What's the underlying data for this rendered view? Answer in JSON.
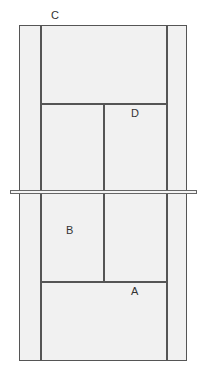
{
  "diagram": {
    "type": "tennis-court",
    "labels": {
      "c": "C",
      "d": "D",
      "b": "B",
      "a": "A"
    },
    "colors": {
      "court_fill": "#f1f1f1",
      "line": "#555555",
      "background": "#ffffff"
    }
  }
}
